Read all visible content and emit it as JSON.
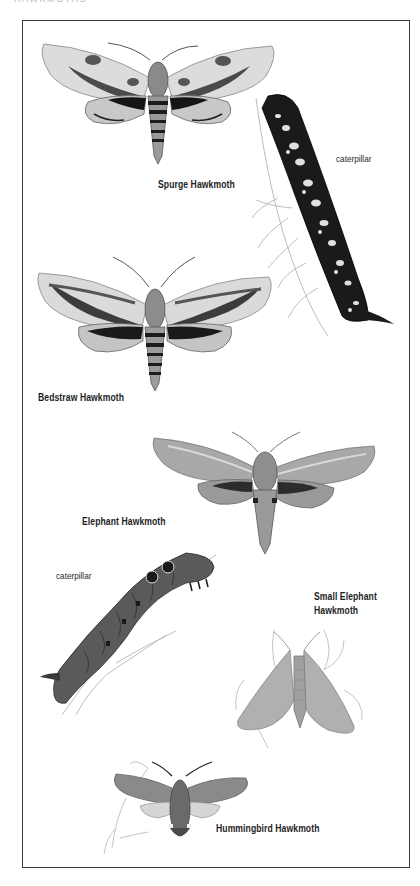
{
  "page": {
    "running_head": "HAWKMOTHS"
  },
  "plate": {
    "species": [
      {
        "id": "spurge",
        "name": "Spurge Hawkmoth",
        "has_caterpillar": true,
        "caterpillar_label": "caterpillar"
      },
      {
        "id": "bedstraw",
        "name": "Bedstraw Hawkmoth",
        "has_caterpillar": false
      },
      {
        "id": "elephant",
        "name": "Elephant Hawkmoth",
        "has_caterpillar": true,
        "caterpillar_label": "caterpillar"
      },
      {
        "id": "small-elephant",
        "name_line1": "Small Elephant",
        "name_line2": "Hawkmoth",
        "has_caterpillar": false
      },
      {
        "id": "hummingbird",
        "name": "Hummingbird Hawkmoth",
        "has_caterpillar": false
      }
    ]
  },
  "palette": {
    "frame": "#3a3a3a",
    "ink_dark": "#1e1e1e",
    "wing_light": "#d9d9d9",
    "wing_mid": "#9a9a9a",
    "wing_dark": "#3c3c3c",
    "caterpillar_dark": "#1a1a1a",
    "caterpillar_grey": "#5a5a5a",
    "plant_line": "#b5b5b5"
  }
}
